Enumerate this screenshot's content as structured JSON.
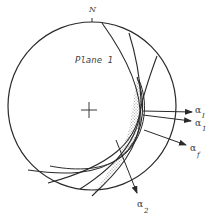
{
  "diagram": {
    "type": "stereonet",
    "north_label": "N",
    "plane_label": "Plane 1",
    "center_marker": "+",
    "colors": {
      "line": "#2a2a2a",
      "stipple": "#9a9a9a",
      "background": "#ffffff"
    },
    "arrows": [
      {
        "id": "alpha_I",
        "symbol": "α",
        "subscript": "I"
      },
      {
        "id": "alpha_1",
        "symbol": "α",
        "subscript": "1"
      },
      {
        "id": "alpha_f",
        "symbol": "α",
        "subscript": "f"
      },
      {
        "id": "alpha_2",
        "symbol": "α",
        "subscript": "2"
      }
    ],
    "shaded_region": "stippled wedge of overlapping planes"
  }
}
